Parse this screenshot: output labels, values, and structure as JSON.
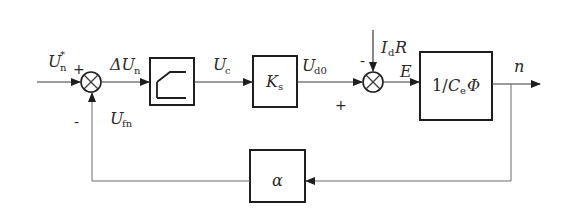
{
  "diagram": {
    "type": "control-block-diagram",
    "signals": {
      "reference": {
        "base": "U",
        "sub": "n",
        "sup": "*"
      },
      "error": {
        "base": "ΔU",
        "sub": "n"
      },
      "control": {
        "base": "U",
        "sub": "c"
      },
      "converter_output": {
        "base": "U",
        "sub": "d0"
      },
      "disturbance": {
        "base": "I",
        "sub": "d",
        "suffix": "R"
      },
      "emf": {
        "base": "E"
      },
      "output": {
        "base": "n"
      },
      "feedback": {
        "base": "U",
        "sub": "fn"
      }
    },
    "blocks": [
      {
        "id": "saturation",
        "label": "",
        "icon": "saturation-icon"
      },
      {
        "id": "converter",
        "label_base": "K",
        "label_sub": "s"
      },
      {
        "id": "motor",
        "label_prefix": "1/",
        "label_base": "C",
        "label_sub": "e",
        "label_suffix": "Φ"
      },
      {
        "id": "feedback",
        "label": "α"
      }
    ],
    "junctions": [
      {
        "id": "sum1",
        "signs": {
          "left": "+",
          "bottom": "-"
        }
      },
      {
        "id": "sum2",
        "signs": {
          "top": "-",
          "left": "+"
        }
      }
    ]
  }
}
